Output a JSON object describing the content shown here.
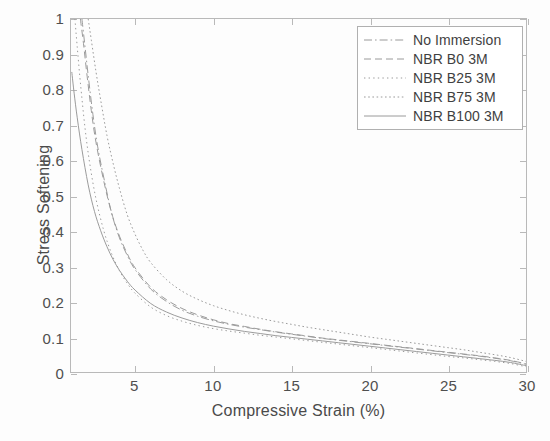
{
  "chart_data": {
    "type": "line",
    "title": "",
    "xlabel": "Compressive Strain (%)",
    "ylabel": "Stress Softening",
    "xlim": [
      0.9,
      30
    ],
    "ylim": [
      0,
      1
    ],
    "xticks": [
      5,
      10,
      15,
      20,
      25,
      30
    ],
    "xticklabels": [
      "5",
      "10",
      "15",
      "20",
      "25",
      "30"
    ],
    "yticks": [
      0,
      0.1,
      0.2,
      0.3,
      0.4,
      0.5,
      0.6,
      0.7,
      0.8,
      0.9,
      1
    ],
    "yticklabels": [
      "0",
      "0.1",
      "0.2",
      "0.3",
      "0.4",
      "0.5",
      "0.6",
      "0.7",
      "0.8",
      "0.9",
      "1"
    ],
    "grid": false,
    "legend_position": "top-right",
    "line_color": "#9a9a9a",
    "series": [
      {
        "name": "No Immersion",
        "style": "dashdot",
        "x": [
          1.6,
          1.8,
          2.0,
          2.3,
          2.6,
          3.0,
          3.5,
          4.0,
          4.5,
          5.0,
          6.0,
          7.0,
          8.0,
          9.0,
          10.0,
          11.0,
          12.0,
          13.0,
          14.0,
          15.0,
          16.0,
          17.0,
          18.0,
          19.0,
          20.0,
          21.0,
          22.0,
          23.0,
          24.0,
          25.0,
          26.0,
          27.0,
          28.0,
          29.0,
          30.0
        ],
        "y": [
          1.0,
          0.92,
          0.84,
          0.73,
          0.64,
          0.55,
          0.45,
          0.38,
          0.33,
          0.29,
          0.235,
          0.2,
          0.175,
          0.158,
          0.145,
          0.135,
          0.127,
          0.12,
          0.113,
          0.107,
          0.101,
          0.095,
          0.09,
          0.085,
          0.08,
          0.075,
          0.07,
          0.065,
          0.06,
          0.055,
          0.05,
          0.045,
          0.039,
          0.032,
          0.022
        ]
      },
      {
        "name": "NBR B0 3M",
        "style": "dashed",
        "x": [
          1.5,
          1.7,
          1.9,
          2.2,
          2.5,
          3.0,
          3.5,
          4.0,
          4.5,
          5.0,
          6.0,
          7.0,
          8.0,
          9.0,
          10.0,
          11.0,
          12.0,
          13.0,
          14.0,
          15.0,
          16.0,
          17.0,
          18.0,
          19.0,
          20.0,
          21.0,
          22.0,
          23.0,
          24.0,
          25.0,
          26.0,
          27.0,
          28.0,
          29.0,
          30.0
        ],
        "y": [
          1.0,
          0.93,
          0.85,
          0.74,
          0.65,
          0.54,
          0.45,
          0.385,
          0.335,
          0.295,
          0.24,
          0.205,
          0.18,
          0.162,
          0.148,
          0.137,
          0.129,
          0.121,
          0.114,
          0.108,
          0.102,
          0.096,
          0.091,
          0.086,
          0.081,
          0.076,
          0.071,
          0.066,
          0.061,
          0.056,
          0.051,
          0.046,
          0.04,
          0.033,
          0.023
        ]
      },
      {
        "name": "NBR B25 3M",
        "style": "dotted-fine",
        "x": [
          1.15,
          1.3,
          1.5,
          1.8,
          2.1,
          2.5,
          3.0,
          3.5,
          4.0,
          4.5,
          5.0,
          6.0,
          7.0,
          8.0,
          9.0,
          10.0,
          11.0,
          12.0,
          13.0,
          14.0,
          15.0,
          16.0,
          17.0,
          18.0,
          19.0,
          20.0,
          21.0,
          22.0,
          23.0,
          24.0,
          25.0,
          26.0,
          27.0,
          28.0,
          29.0,
          30.0
        ],
        "y": [
          1.0,
          0.92,
          0.82,
          0.69,
          0.59,
          0.49,
          0.4,
          0.335,
          0.287,
          0.251,
          0.223,
          0.184,
          0.16,
          0.144,
          0.132,
          0.123,
          0.116,
          0.11,
          0.104,
          0.099,
          0.094,
          0.089,
          0.084,
          0.079,
          0.074,
          0.069,
          0.064,
          0.059,
          0.054,
          0.049,
          0.044,
          0.04,
          0.035,
          0.03,
          0.024,
          0.015
        ]
      },
      {
        "name": "NBR B75 3M",
        "style": "dotted",
        "x": [
          2.0,
          2.2,
          2.5,
          2.8,
          3.2,
          3.6,
          4.0,
          4.5,
          5.0,
          5.5,
          6.0,
          7.0,
          8.0,
          9.0,
          10.0,
          11.0,
          12.0,
          13.0,
          14.0,
          15.0,
          16.0,
          17.0,
          18.0,
          19.0,
          20.0,
          21.0,
          22.0,
          23.0,
          24.0,
          25.0,
          26.0,
          27.0,
          28.0,
          29.0,
          30.0
        ],
        "y": [
          1.0,
          0.94,
          0.85,
          0.77,
          0.67,
          0.59,
          0.52,
          0.445,
          0.39,
          0.345,
          0.31,
          0.262,
          0.229,
          0.206,
          0.188,
          0.174,
          0.162,
          0.152,
          0.143,
          0.135,
          0.127,
          0.12,
          0.113,
          0.106,
          0.099,
          0.093,
          0.087,
          0.081,
          0.075,
          0.069,
          0.063,
          0.056,
          0.049,
          0.041,
          0.03
        ]
      },
      {
        "name": "NBR B100 3M",
        "style": "solid",
        "x": [
          0.95,
          1.1,
          1.3,
          1.6,
          2.0,
          2.4,
          2.8,
          3.2,
          3.6,
          4.0,
          4.5,
          5.0,
          6.0,
          7.0,
          8.0,
          9.0,
          10.0,
          11.0,
          12.0,
          13.0,
          14.0,
          15.0,
          16.0,
          17.0,
          18.0,
          19.0,
          20.0,
          21.0,
          22.0,
          23.0,
          24.0,
          25.0,
          26.0,
          27.0,
          28.0,
          29.0,
          30.0
        ],
        "y": [
          0.85,
          0.79,
          0.72,
          0.63,
          0.53,
          0.455,
          0.4,
          0.355,
          0.318,
          0.288,
          0.257,
          0.232,
          0.194,
          0.17,
          0.153,
          0.14,
          0.13,
          0.122,
          0.115,
          0.109,
          0.103,
          0.098,
          0.093,
          0.088,
          0.083,
          0.078,
          0.073,
          0.068,
          0.063,
          0.058,
          0.053,
          0.048,
          0.043,
          0.038,
          0.033,
          0.027,
          0.018
        ]
      }
    ]
  }
}
